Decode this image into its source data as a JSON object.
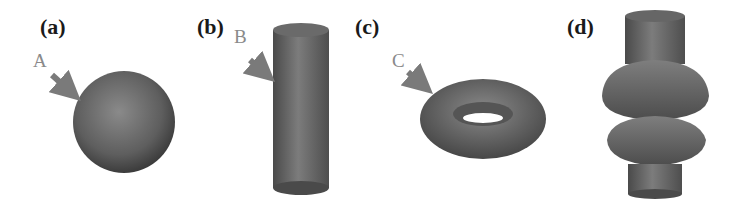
{
  "panels": [
    {
      "label": "(a)",
      "shape": "sphere",
      "callout": "A"
    },
    {
      "label": "(b)",
      "shape": "cylinder",
      "callout": "B"
    },
    {
      "label": "(c)",
      "shape": "torus",
      "callout": "C"
    },
    {
      "label": "(d)",
      "shape": "compound-solid",
      "callout": ""
    }
  ],
  "colors": {
    "shape_fill": "#6e6e6e",
    "shape_dark": "#3a3a3a",
    "arrow": "#7a7a7a",
    "label": "#1a1a1a",
    "callout": "#8a8a8a"
  }
}
